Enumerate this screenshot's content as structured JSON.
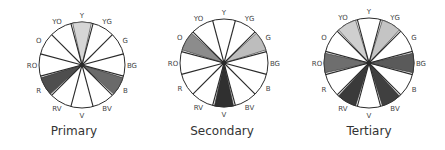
{
  "segments": [
    "Y",
    "YG",
    "G",
    "BG",
    "B",
    "BV",
    "V",
    "RV",
    "R",
    "RO",
    "O",
    "YO"
  ],
  "wheels": [
    {
      "caption": "Primary",
      "cx": 82,
      "cy": 65,
      "r": 43,
      "left": 0,
      "shaded": {
        "Y": "#d6d6d6",
        "B": "#6a6a6a",
        "R": "#4e4e4e"
      }
    },
    {
      "caption": "Secondary",
      "cx": 76,
      "cy": 63,
      "r": 44,
      "left": 148,
      "shaded": {
        "O": "#8c8c8c",
        "G": "#bdbdbd",
        "V": "#303030"
      }
    },
    {
      "caption": "Tertiary",
      "cx": 74,
      "cy": 63,
      "r": 45,
      "left": 295,
      "shaded": {
        "YO": "#cfcfcf",
        "YG": "#c4c4c4",
        "BG": "#5a5a5a",
        "BV": "#404040",
        "RV": "#3a3a3a",
        "RO": "#6e6e6e"
      }
    }
  ],
  "colors": {
    "line": "#2a2a2a",
    "fill": "#ffffff",
    "label": "#444444"
  }
}
